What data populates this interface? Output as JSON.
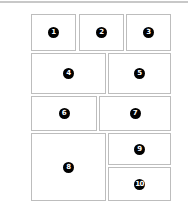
{
  "layout": {
    "panels": [
      {
        "label": "1",
        "x": 31,
        "y": 14,
        "w": 45,
        "h": 37
      },
      {
        "label": "2",
        "x": 79,
        "y": 14,
        "w": 45,
        "h": 37
      },
      {
        "label": "3",
        "x": 126,
        "y": 14,
        "w": 45,
        "h": 37
      },
      {
        "label": "4",
        "x": 31,
        "y": 53,
        "w": 75,
        "h": 41
      },
      {
        "label": "5",
        "x": 108,
        "y": 53,
        "w": 63,
        "h": 41
      },
      {
        "label": "6",
        "x": 31,
        "y": 96,
        "w": 66,
        "h": 35
      },
      {
        "label": "7",
        "x": 99,
        "y": 96,
        "w": 72,
        "h": 35
      },
      {
        "label": "8",
        "x": 31,
        "y": 133,
        "w": 75,
        "h": 68
      },
      {
        "label": "9",
        "x": 108,
        "y": 133,
        "w": 63,
        "h": 32
      },
      {
        "label": "10",
        "x": 108,
        "y": 167,
        "w": 63,
        "h": 34
      }
    ]
  }
}
